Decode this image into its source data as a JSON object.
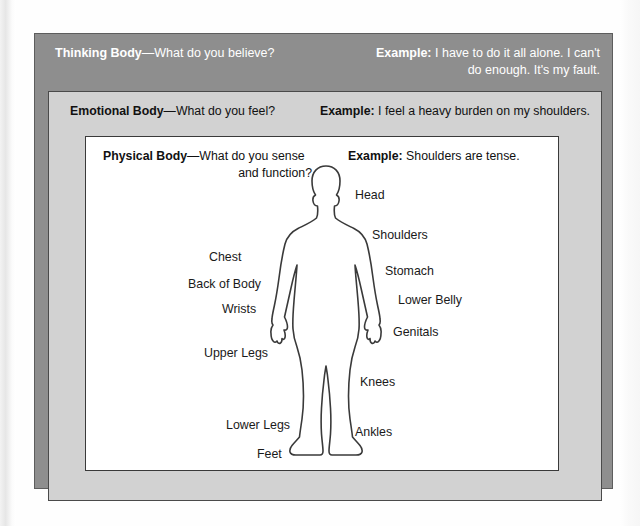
{
  "diagram": {
    "title_semantic": "three-nested-bodies-diagram",
    "colors": {
      "outer_band": "#8e8e8e",
      "middle_band": "#d2d2d2",
      "inner_panel": "#ffffff",
      "outer_text": "#ffffff",
      "body_text": "#1a1a1a",
      "outline_stroke": "#3a3a3a"
    }
  },
  "layers": {
    "thinking": {
      "name_bold": "Thinking Body",
      "question": "—What do you believe?",
      "example_label": "Example:",
      "example_line1": "I have to do it all alone. I can't",
      "example_line2": "do enough. It's my fault."
    },
    "emotional": {
      "name_bold": "Emotional Body",
      "question": "—What do you feel?",
      "example_label": "Example:",
      "example_text": "I feel a heavy burden on my shoulders."
    },
    "physical": {
      "name_bold": "Physical Body",
      "question": "—What do you sense",
      "question_line2": "and function?",
      "example_label": "Example:",
      "example_text": "Shoulders are tense."
    }
  },
  "body_labels": [
    {
      "id": "head",
      "text": "Head",
      "x": 355,
      "y": 188
    },
    {
      "id": "shoulders",
      "text": "Shoulders",
      "x": 372,
      "y": 228
    },
    {
      "id": "chest",
      "text": "Chest",
      "x": 209,
      "y": 250
    },
    {
      "id": "stomach",
      "text": "Stomach",
      "x": 385,
      "y": 264
    },
    {
      "id": "back-of-body",
      "text": "Back of Body",
      "x": 188,
      "y": 277
    },
    {
      "id": "lower-belly",
      "text": "Lower Belly",
      "x": 398,
      "y": 293
    },
    {
      "id": "wrists",
      "text": "Wrists",
      "x": 222,
      "y": 302
    },
    {
      "id": "genitals",
      "text": "Genitals",
      "x": 393,
      "y": 325
    },
    {
      "id": "upper-legs",
      "text": "Upper Legs",
      "x": 204,
      "y": 346
    },
    {
      "id": "knees",
      "text": "Knees",
      "x": 360,
      "y": 375
    },
    {
      "id": "lower-legs",
      "text": "Lower Legs",
      "x": 226,
      "y": 418
    },
    {
      "id": "ankles",
      "text": "Ankles",
      "x": 355,
      "y": 425
    },
    {
      "id": "feet",
      "text": "Feet",
      "x": 257,
      "y": 447
    }
  ],
  "figure": {
    "name": "human-body-outline"
  }
}
